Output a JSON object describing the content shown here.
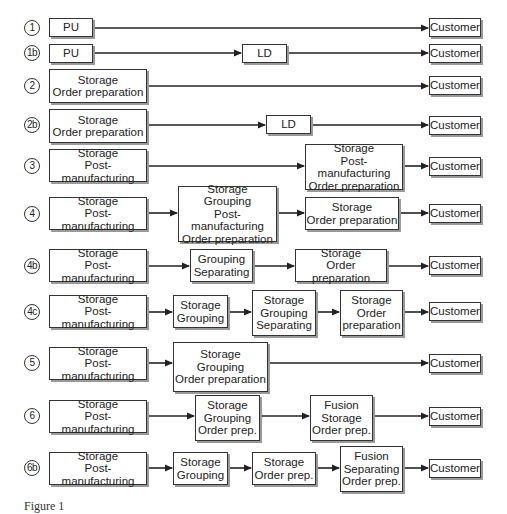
{
  "diagram": {
    "type": "flow-diagram",
    "rows": [
      {
        "id": "1",
        "label": "1",
        "nodes": [
          "PU",
          "Customer"
        ]
      },
      {
        "id": "1b",
        "label": "1b",
        "nodes": [
          "PU",
          "LD",
          "Customer"
        ]
      },
      {
        "id": "2",
        "label": "2",
        "nodes": [
          "Storage\nOrder preparation",
          "Customer"
        ]
      },
      {
        "id": "2b",
        "label": "2b",
        "nodes": [
          "Storage\nOrder preparation",
          "LD",
          "Customer"
        ]
      },
      {
        "id": "3",
        "label": "3",
        "nodes": [
          "Storage\nPost-manufacturing",
          "Storage\nPost-manufacturing\nOrder preparation",
          "Customer"
        ]
      },
      {
        "id": "4",
        "label": "4",
        "nodes": [
          "Storage\nPost-manufacturing",
          "Storage\nGrouping\nPost-manufacturing\nOrder preparation",
          "Storage\nOrder preparation",
          "Customer"
        ]
      },
      {
        "id": "4b",
        "label": "4b",
        "nodes": [
          "Storage\nPost-manufacturing",
          "Grouping\nSeparating",
          "Storage\nOrder preparation",
          "Customer"
        ]
      },
      {
        "id": "4c",
        "label": "4c",
        "nodes": [
          "Storage\nPost-manufacturing",
          "Storage\nGrouping",
          "Storage\nGrouping\nSeparating",
          "Storage\nOrder\npreparation",
          "Customer"
        ]
      },
      {
        "id": "5",
        "label": "5",
        "nodes": [
          "Storage\nPost-manufacturing",
          "Storage\nGrouping\nOrder preparation",
          "Customer"
        ]
      },
      {
        "id": "6",
        "label": "6",
        "nodes": [
          "Storage\nPost-manufacturing",
          "Storage\nGrouping\nOrder prep.",
          "Fusion\nStorage\nOrder prep.",
          "Customer"
        ]
      },
      {
        "id": "6b",
        "label": "6b",
        "nodes": [
          "Storage\nPost-manufacturing",
          "Storage\nGrouping",
          "Storage\nOrder prep.",
          "Fusion\nSeparating\nOrder prep.",
          "Customer"
        ]
      }
    ],
    "caption": "Figure 1"
  },
  "colors": {
    "line": "#222222",
    "box_border": "#333333",
    "box_shadow": "#9a9a9a",
    "background": "#ffffff"
  }
}
